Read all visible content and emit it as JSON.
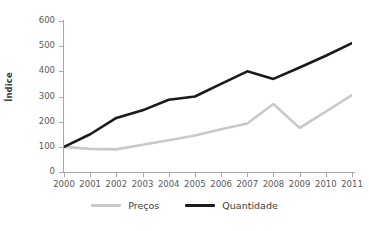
{
  "chart_data": {
    "type": "line",
    "title": "",
    "xlabel": "",
    "ylabel": "Índice",
    "categories": [
      "2000",
      "2001",
      "2002",
      "2003",
      "2004",
      "2005",
      "2006",
      "2007",
      "2008",
      "2009",
      "2010",
      "2011"
    ],
    "ylim": [
      0,
      600
    ],
    "yticks": [
      0,
      100,
      200,
      300,
      400,
      500,
      600
    ],
    "grid": false,
    "legend_position": "bottom",
    "series": [
      {
        "name": "Preços",
        "color": "#c9c9c9",
        "values": [
          100,
          92,
          90,
          108,
          126,
          145,
          170,
          193,
          270,
          175,
          240,
          306
        ]
      },
      {
        "name": "Quantidade",
        "color": "#1a1a1a",
        "values": [
          100,
          150,
          215,
          245,
          287,
          300,
          350,
          400,
          370,
          415,
          462,
          512
        ]
      }
    ]
  },
  "axis": {
    "y_title": "Índice"
  },
  "title_sliver": {
    "text": ""
  },
  "legend": {
    "items": [
      {
        "label": "Preços",
        "color": "#c9c9c9"
      },
      {
        "label": "Quantidade",
        "color": "#1a1a1a"
      }
    ]
  }
}
